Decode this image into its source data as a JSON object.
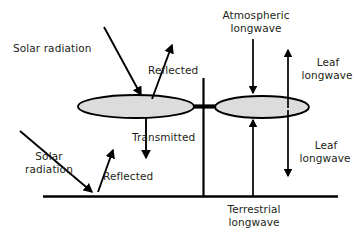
{
  "figure": {
    "type": "diagram",
    "background_color": "#ffffff",
    "line_color": "#000000",
    "text_color": "#231f20",
    "leaf_fill_color": "#dcdcdc"
  },
  "labels": {
    "solar_radiation_top": "Solar radiation",
    "reflected_top": "Reflected",
    "atmospheric_longwave_line1": "Atmospheric",
    "atmospheric_longwave_line2": "longwave",
    "leaf_longwave_up_line1": "Leaf",
    "leaf_longwave_up_line2": "longwave",
    "transmitted": "Transmitted",
    "leaf_longwave_down_line1": "Leaf",
    "leaf_longwave_down_line2": "longwave",
    "solar_radiation_bottom_line1": "Solar",
    "solar_radiation_bottom_line2": "radiation",
    "reflected_bottom": "Reflected",
    "terrestrial_longwave_line1": "Terrestrial",
    "terrestrial_longwave_line2": "longwave"
  },
  "elements": {
    "upper_leaf": "upper-leaf-ellipse",
    "lower_leaf": "lower-leaf-ellipse",
    "stem": "plant-stem",
    "petiole": "leaf-petiole-bar",
    "ground": "ground-surface-line"
  },
  "arrows": {
    "solar_incoming_top": "arrow-solar-radiation-incoming-upper",
    "solar_reflected_top": "arrow-reflected-upper-leaf",
    "atmospheric_longwave_down": "arrow-atmospheric-longwave-incoming",
    "leaf_longwave_up": "arrow-leaf-longwave-emitted-upward",
    "transmitted_down": "arrow-transmitted-through-leaf",
    "leaf_longwave_down": "arrow-leaf-longwave-emitted-downward",
    "terrestrial_longwave_up": "arrow-terrestrial-longwave-from-ground",
    "solar_incoming_bottom": "arrow-solar-radiation-incoming-ground",
    "solar_reflected_bottom": "arrow-reflected-from-ground"
  }
}
